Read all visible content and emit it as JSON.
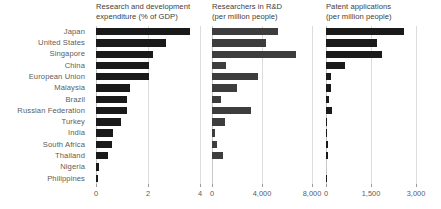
{
  "chart_data": {
    "type": "bar",
    "orientation": "horizontal",
    "title": "",
    "grid": true,
    "legend": "none",
    "shared_categories_axis": "left",
    "categories": [
      "Japan",
      "United States",
      "Singapore",
      "China",
      "European Union",
      "Malaysia",
      "Brazil",
      "Russian Federation",
      "Turkey",
      "India",
      "South Africa",
      "Thailand",
      "Nigeria",
      "Philippines"
    ],
    "panels": [
      {
        "id": "rd-expenditure",
        "title_line1": "Research and development",
        "title_line2": "expenditure (% of GDP)",
        "xlabel": "",
        "ylabel": "",
        "xlim": [
          0,
          4
        ],
        "ticks": [
          0,
          2,
          4
        ],
        "tick_labels": [
          "0",
          "2",
          "4"
        ],
        "bar_color": "#1a1a1a",
        "values": [
          3.6,
          2.7,
          2.2,
          2.05,
          2.03,
          1.3,
          1.2,
          1.2,
          0.95,
          0.65,
          0.6,
          0.45,
          0.12,
          0.08
        ]
      },
      {
        "id": "researchers-in-rd",
        "title_line1": "Researchers in R&D",
        "title_line2": "(per million people)",
        "xlabel": "",
        "ylabel": "",
        "xlim": [
          0,
          8000
        ],
        "ticks": [
          0,
          4000,
          8000
        ],
        "tick_labels": [
          "0",
          "4,000",
          "8,000"
        ],
        "bar_color": "#3d3d3d",
        "values": [
          5300,
          4300,
          6700,
          1100,
          3700,
          2000,
          700,
          3100,
          1050,
          200,
          420,
          900,
          0,
          0
        ]
      },
      {
        "id": "patent-applications",
        "title_line1": "Patent applications",
        "title_line2": "(per million people)",
        "xlabel": "",
        "ylabel": "",
        "xlim": [
          0,
          3000
        ],
        "ticks": [
          0,
          1500,
          3000
        ],
        "tick_labels": [
          "0",
          "1,500",
          "3,000"
        ],
        "bar_color": "#1a1a1a",
        "values": [
          2600,
          1700,
          1850,
          620,
          175,
          170,
          95,
          185,
          35,
          18,
          65,
          60,
          0,
          14
        ]
      }
    ]
  }
}
